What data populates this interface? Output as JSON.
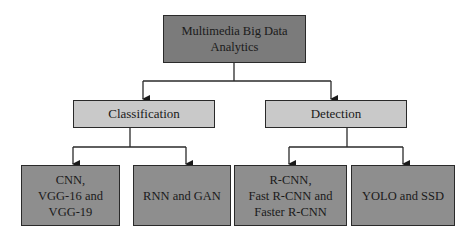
{
  "colors": {
    "root_fill": "#7b7b7b",
    "category_fill": "#c9c9c9",
    "leaf_fill": "#8e8e8e",
    "line": "#2a2a2a"
  },
  "root": {
    "label": "Multimedia Big Data\nAnalytics"
  },
  "categories": [
    {
      "label": "Classification",
      "children": [
        {
          "label": "CNN,\nVGG-16 and\nVGG-19"
        },
        {
          "label": "RNN and GAN"
        }
      ]
    },
    {
      "label": "Detection",
      "children": [
        {
          "label": "R-CNN,\nFast R-CNN and\nFaster R-CNN"
        },
        {
          "label": "YOLO and SSD"
        }
      ]
    }
  ]
}
